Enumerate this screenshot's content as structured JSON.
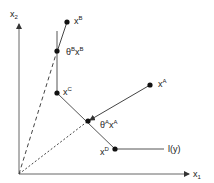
{
  "diagram": {
    "type": "vector geometry diagram",
    "axes": {
      "x_label": "x",
      "x_sub": "1",
      "y_label": "x",
      "y_sub": "2"
    },
    "points": [
      {
        "id": "xB",
        "base": "x",
        "sup": "B"
      },
      {
        "id": "thetaBxB",
        "theta": "θ",
        "theta_sup": "B",
        "base": "x",
        "sup": "B"
      },
      {
        "id": "xC",
        "base": "x",
        "sup": "C"
      },
      {
        "id": "thetaAxA",
        "theta": "θ",
        "theta_sup": "A",
        "base": "x",
        "sup": "A"
      },
      {
        "id": "xA",
        "base": "x",
        "sup": "A"
      },
      {
        "id": "xD",
        "base": "x",
        "sup": "D"
      }
    ],
    "isoquant_label": "l(y)",
    "colors": {
      "line": "#555555",
      "point": "#111111",
      "background": "#ffffff"
    }
  }
}
